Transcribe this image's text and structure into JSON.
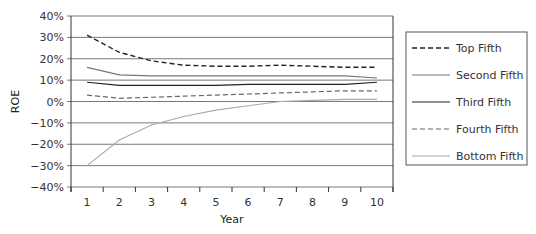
{
  "chart_data": {
    "type": "line",
    "title": "",
    "xlabel": "Year",
    "ylabel": "ROE",
    "ylim": [
      -40,
      40
    ],
    "yticks": [
      "40%",
      "30%",
      "20%",
      "10%",
      "0%",
      "−10%",
      "−20%",
      "−30%",
      "−40%"
    ],
    "categories": [
      "1",
      "2",
      "3",
      "4",
      "5",
      "6",
      "7",
      "8",
      "9",
      "10"
    ],
    "grid": true,
    "legend_position": "right",
    "series": [
      {
        "name": "Top Fifth",
        "style": "dashed",
        "color": "#222222",
        "values": [
          31,
          23,
          19,
          17,
          16.5,
          16.5,
          17,
          16.5,
          16,
          16
        ]
      },
      {
        "name": "Second Fifth",
        "style": "solid",
        "color": "#777777",
        "values": [
          16,
          12.5,
          12,
          12,
          12,
          12,
          12,
          12,
          12,
          11
        ]
      },
      {
        "name": "Third Fifth",
        "style": "solid",
        "color": "#222222",
        "values": [
          9,
          7.5,
          7.5,
          7.5,
          7.5,
          8,
          8,
          8,
          8,
          9
        ]
      },
      {
        "name": "Fourth Fifth",
        "style": "dashed",
        "color": "#666666",
        "values": [
          3,
          1.5,
          2,
          2.5,
          3,
          3.5,
          4,
          4.5,
          5,
          5
        ]
      },
      {
        "name": "Bottom Fifth",
        "style": "solid",
        "color": "#aaaaaa",
        "values": [
          -30,
          -18,
          -11,
          -7,
          -4,
          -2,
          0,
          0.5,
          1,
          1
        ]
      }
    ]
  }
}
